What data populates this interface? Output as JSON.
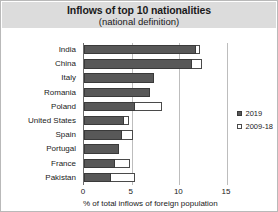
{
  "chart_data": {
    "type": "bar",
    "orientation": "horizontal",
    "title": "Inflows of top 10 nationalities",
    "subtitle": "(national definition)",
    "xlabel": "% of total inflows of foreign population",
    "ylabel": "",
    "xlim": [
      0,
      15
    ],
    "xticks": [
      0,
      5,
      10,
      15
    ],
    "xtick_labels": [
      "0",
      "5",
      "10",
      "15"
    ],
    "gridlines": [
      5,
      10,
      15
    ],
    "grid": true,
    "legend_position": "right",
    "categories": [
      "India",
      "China",
      "Italy",
      "Romania",
      "Poland",
      "United States",
      "Spain",
      "Portugal",
      "France",
      "Pakistan"
    ],
    "series": [
      {
        "name": "2019",
        "color": "#585858",
        "style": "filled",
        "values": [
          11.7,
          11.3,
          7.3,
          6.9,
          5.4,
          4.2,
          4.0,
          3.7,
          3.2,
          2.8
        ]
      },
      {
        "name": "2009-18",
        "color": "#ffffff",
        "style": "hollow",
        "values": [
          12.2,
          12.4,
          7.3,
          6.9,
          8.2,
          4.7,
          5.1,
          3.7,
          4.8,
          5.3
        ]
      }
    ]
  },
  "legend": {
    "items": [
      {
        "label": "2019",
        "swatch": "filled"
      },
      {
        "label": "2009-18",
        "swatch": "hollow"
      }
    ]
  }
}
